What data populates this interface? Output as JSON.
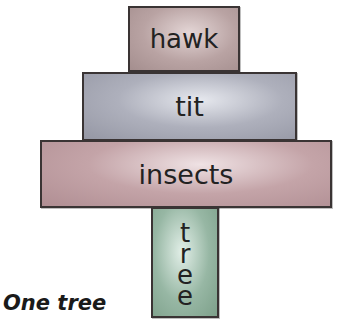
{
  "pyramid": {
    "levels": [
      {
        "label": "hawk",
        "color": "#b9a3a3"
      },
      {
        "label": "tit",
        "color": "#aeb0bc"
      },
      {
        "label": "insects",
        "color": "#c4a4a8"
      },
      {
        "label": "tree",
        "color": "#97b7a4",
        "letters": [
          "t",
          "r",
          "e",
          "e"
        ]
      }
    ]
  },
  "caption": "One tree"
}
